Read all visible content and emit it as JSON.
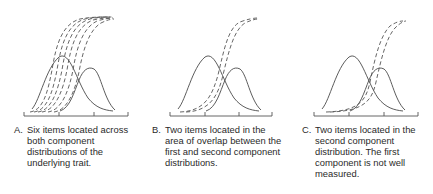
{
  "panels": [
    {
      "label": "A.",
      "caption_lines": [
        "Six items located across",
        "both component",
        "distributions of the",
        "underlying trait."
      ],
      "num_items": 6
    },
    {
      "label": "B.",
      "caption_lines": [
        "Two items located in the",
        "area of overlap between the",
        "first and second component",
        "distributions."
      ],
      "num_items": 2
    },
    {
      "label": "C.",
      "caption_lines": [
        "Two items located in the",
        "second component",
        "distribution. The first",
        "component is not well",
        "measured."
      ],
      "num_items": 2
    }
  ],
  "colors": {
    "solid_curve": "#4a4a4a",
    "dashed_curve": "#555555",
    "axis": "#555555"
  }
}
